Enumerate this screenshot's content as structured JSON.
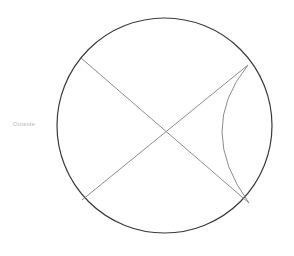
{
  "figure": {
    "background_color": "#ffffff",
    "canvas": {
      "width": 294,
      "height": 256
    },
    "circle": {
      "name": "main-circle",
      "center_x": 164.5,
      "center_y": 125.5,
      "radius": 107.5,
      "stroke_color": "#3a3a3a",
      "stroke_width": 1.2,
      "fill": "none"
    },
    "points": [
      {
        "id": "A",
        "label": "",
        "x": 81,
        "y": 58,
        "description": "upper-left chord endpoint on circle"
      },
      {
        "id": "B",
        "label": "",
        "x": 248,
        "y": 65,
        "description": "upper-right chord endpoint on circle"
      },
      {
        "id": "C",
        "label": "",
        "x": 249,
        "y": 203,
        "description": "lower-right chord endpoint on circle"
      },
      {
        "id": "D",
        "label": "",
        "x": 82,
        "y": 200,
        "description": "lower-left chord endpoint on circle"
      },
      {
        "id": "X",
        "label": "",
        "x": 165,
        "y": 131,
        "description": "intersection of the two chords"
      }
    ],
    "chords": [
      {
        "name": "chord-upper-left-to-lower-right",
        "x1": 81,
        "y1": 58,
        "x2": 249,
        "y2": 203,
        "stroke_color": "#8c8c8c",
        "stroke_width": 1
      },
      {
        "name": "chord-upper-right-to-lower-left",
        "x1": 248,
        "y1": 65,
        "x2": 82,
        "y2": 200,
        "stroke_color": "#8c8c8c",
        "stroke_width": 1
      }
    ],
    "arc": {
      "name": "inner-arc",
      "start_x": 248,
      "start_y": 65,
      "end_x": 249,
      "end_y": 203,
      "apex_x": 222,
      "apex_y": 132,
      "bulge_direction": "left",
      "stroke_color": "#8c8c8c",
      "stroke_width": 1,
      "fill": "none"
    },
    "labels": [
      {
        "name": "outside-label",
        "text": "Outside",
        "x": 13,
        "y": 120,
        "color": "#b9b9b9",
        "font_size": 6
      }
    ]
  }
}
